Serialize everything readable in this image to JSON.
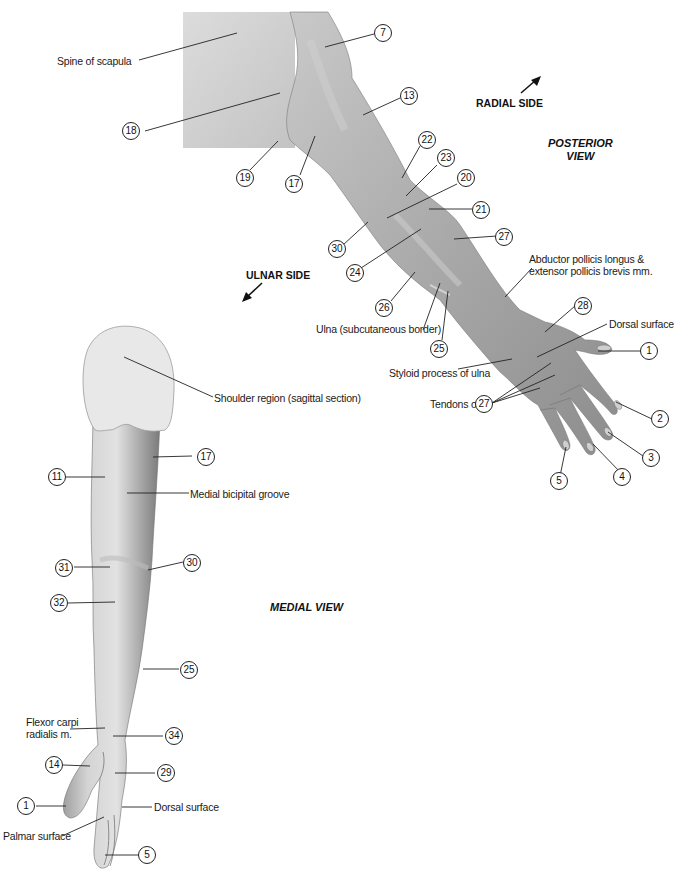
{
  "diagram": {
    "colors": {
      "skin_dark": "#8c8c8c",
      "skin_mid": "#b5b5b5",
      "skin_light": "#d8d8d8",
      "section_fill": "#e4e4e4",
      "leader_line": "#222222"
    },
    "posterior_view": {
      "title_line1": "POSTERIOR",
      "title_line2": "VIEW",
      "radial_side": "RADIAL SIDE",
      "ulnar_side": "ULNAR SIDE",
      "text_labels": {
        "spine_of_scapula": "Spine of scapula",
        "abductor_line1": "Abductor pollicis longus &",
        "abductor_line2": "extensor pollicis brevis mm.",
        "ulna_subcutaneous": "Ulna (subcutaneous border)",
        "styloid_process": "Styloid process of ulna",
        "dorsal_surface": "Dorsal surface",
        "tendons_of": "Tendons of"
      },
      "numbers": [
        "7",
        "18",
        "19",
        "17",
        "13",
        "22",
        "23",
        "20",
        "21",
        "27",
        "30",
        "24",
        "26",
        "25",
        "28",
        "1",
        "27",
        "2",
        "3",
        "4",
        "5"
      ]
    },
    "medial_view": {
      "title": "MEDIAL VIEW",
      "text_labels": {
        "shoulder_region": "Shoulder region (sagittal section)",
        "medial_bicipital_groove": "Medial bicipital groove",
        "flexor_line1": "Flexor carpi",
        "flexor_line2": "radialis m.",
        "dorsal_surface": "Dorsal surface",
        "palmar_surface": "Palmar surface"
      },
      "numbers": [
        "17",
        "11",
        "31",
        "30",
        "32",
        "25",
        "34",
        "14",
        "29",
        "1",
        "5"
      ]
    }
  }
}
